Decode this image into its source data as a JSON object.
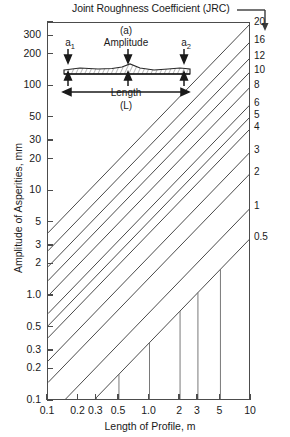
{
  "chart_data": {
    "type": "line",
    "title": "Joint Roughness Coefficient (JRC)",
    "xlabel": "Length of Profile, m",
    "ylabel": "Amplitude of Asperities, mm",
    "xscale": "log",
    "yscale": "log",
    "xlim": [
      0.1,
      10
    ],
    "ylim": [
      0.1,
      400
    ],
    "grid": false,
    "legend_position": "right-axis",
    "xticks": [
      {
        "value": 0.1,
        "label": "0.1"
      },
      {
        "value": 0.2,
        "label": "0.2"
      },
      {
        "value": 0.3,
        "label": "0.3"
      },
      {
        "value": 0.5,
        "label": "0.5"
      },
      {
        "value": 1.0,
        "label": "1.0"
      },
      {
        "value": 2,
        "label": "2"
      },
      {
        "value": 3,
        "label": "3"
      },
      {
        "value": 5,
        "label": "5"
      },
      {
        "value": 10,
        "label": "10"
      }
    ],
    "yticks": [
      {
        "value": 300,
        "label": "300"
      },
      {
        "value": 200,
        "label": "200"
      },
      {
        "value": 100,
        "label": "100"
      },
      {
        "value": 50,
        "label": "50"
      },
      {
        "value": 30,
        "label": "30"
      },
      {
        "value": 20,
        "label": "20"
      },
      {
        "value": 10,
        "label": "10"
      },
      {
        "value": 5,
        "label": "5"
      },
      {
        "value": 3,
        "label": "3"
      },
      {
        "value": 2,
        "label": "2"
      },
      {
        "value": 1.0,
        "label": "1.0"
      },
      {
        "value": 0.5,
        "label": "0.5"
      },
      {
        "value": 0.3,
        "label": "0.3"
      },
      {
        "value": 0.2,
        "label": "0.2"
      },
      {
        "value": 0.1,
        "label": "0.1"
      }
    ],
    "series": [
      {
        "name": "20",
        "jrc": 20,
        "amplitude_at_1m": 40.0,
        "label": "20"
      },
      {
        "name": "16",
        "jrc": 16,
        "amplitude_at_1m": 27.0,
        "label": "16"
      },
      {
        "name": "12",
        "jrc": 12,
        "amplitude_at_1m": 19.0,
        "label": "12"
      },
      {
        "name": "10",
        "jrc": 10,
        "amplitude_at_1m": 14.0,
        "label": "10"
      },
      {
        "name": "8",
        "jrc": 8,
        "amplitude_at_1m": 10.0,
        "label": "8"
      },
      {
        "name": "6",
        "jrc": 6,
        "amplitude_at_1m": 6.8,
        "label": "6"
      },
      {
        "name": "5",
        "jrc": 5,
        "amplitude_at_1m": 5.2,
        "label": "5"
      },
      {
        "name": "4",
        "jrc": 4,
        "amplitude_at_1m": 4.0,
        "label": "4"
      },
      {
        "name": "3",
        "jrc": 3,
        "amplitude_at_1m": 2.4,
        "label": "3"
      },
      {
        "name": "2",
        "jrc": 2,
        "amplitude_at_1m": 1.5,
        "label": "2"
      },
      {
        "name": "1",
        "jrc": 1,
        "amplitude_at_1m": 0.7,
        "label": "1"
      },
      {
        "name": "0.5",
        "jrc": 0.5,
        "amplitude_at_1m": 0.36,
        "label": "0.5"
      }
    ],
    "line_slope_decades": 1.0,
    "line_color": "#4a4a4a",
    "frame_color": "#4c4c4c",
    "annotations": {
      "callout_arrow": "down-arrow at top-right pointing to JRC value column"
    }
  },
  "inset": {
    "name": "(a)",
    "amplitude_label": "Amplitude",
    "a1_label": "a",
    "a1_sub": "1",
    "a2_label": "a",
    "a2_sub": "2",
    "length_label": "Length",
    "length_symbol": "(L)"
  }
}
